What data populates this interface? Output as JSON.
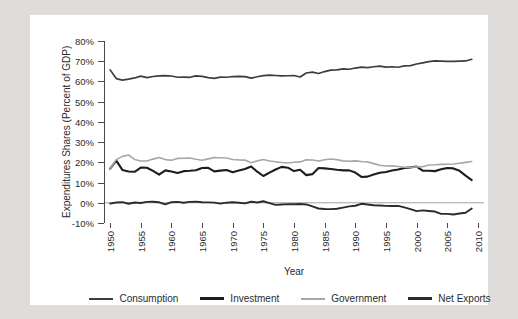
{
  "chart_data": {
    "type": "line",
    "title": "",
    "xlabel": "Year",
    "ylabel": "Expenditures Shares (Percent of GDP)",
    "xlim": [
      1949,
      2011
    ],
    "ylim": [
      -10,
      80
    ],
    "ytick_labels": [
      "80%",
      "70%",
      "60%",
      "50%",
      "40%",
      "30%",
      "20%",
      "10%",
      "0%",
      "-10%"
    ],
    "ytick_values": [
      80,
      70,
      60,
      50,
      40,
      30,
      20,
      10,
      0,
      -10
    ],
    "xtick_labels": [
      "1950",
      "1955",
      "1960",
      "1965",
      "1970",
      "1975",
      "1980",
      "1985",
      "1990",
      "1995",
      "2000",
      "2005",
      "2010"
    ],
    "xtick_values": [
      1950,
      1955,
      1960,
      1965,
      1970,
      1975,
      1980,
      1985,
      1990,
      1995,
      2000,
      2005,
      2010
    ],
    "grid": false,
    "legend_position": "bottom",
    "x": [
      1950,
      1951,
      1952,
      1953,
      1954,
      1955,
      1956,
      1957,
      1958,
      1959,
      1960,
      1961,
      1962,
      1963,
      1964,
      1965,
      1966,
      1967,
      1968,
      1969,
      1970,
      1971,
      1972,
      1973,
      1974,
      1975,
      1976,
      1977,
      1978,
      1979,
      1980,
      1981,
      1982,
      1983,
      1984,
      1985,
      1986,
      1987,
      1988,
      1989,
      1990,
      1991,
      1992,
      1993,
      1994,
      1995,
      1996,
      1997,
      1998,
      1999,
      2000,
      2001,
      2002,
      2003,
      2004,
      2005,
      2006,
      2007,
      2008,
      2009
    ],
    "series": [
      {
        "name": "Consumption",
        "color": "#3d3d3d",
        "width": 1.7,
        "values": [
          66.0,
          61.2,
          60.8,
          61.3,
          61.6,
          62.6,
          62.0,
          62.3,
          62.6,
          62.9,
          62.6,
          62.0,
          62.0,
          62.2,
          62.8,
          62.4,
          61.8,
          61.8,
          62.0,
          62.1,
          62.2,
          62.3,
          62.6,
          61.6,
          62.1,
          62.8,
          63.0,
          62.9,
          62.5,
          62.6,
          63.0,
          62.3,
          64.0,
          64.7,
          64.1,
          65.0,
          65.6,
          65.8,
          66.0,
          66.0,
          66.5,
          66.9,
          67.1,
          67.4,
          67.5,
          67.1,
          67.3,
          67.2,
          67.5,
          68.1,
          68.7,
          69.3,
          69.7,
          69.9,
          70.0,
          70.1,
          70.0,
          70.2,
          70.2,
          71.0
        ]
      },
      {
        "name": "Investment",
        "color": "#1d1d1d",
        "width": 2.1,
        "values": [
          17.0,
          20.8,
          16.2,
          15.6,
          15.1,
          17.4,
          17.1,
          15.7,
          13.8,
          16.0,
          15.5,
          14.6,
          15.4,
          15.9,
          16.0,
          17.3,
          17.2,
          15.6,
          16.0,
          16.3,
          14.9,
          15.7,
          16.9,
          17.8,
          15.6,
          13.3,
          15.1,
          16.7,
          17.5,
          17.5,
          15.6,
          16.5,
          13.7,
          14.1,
          17.4,
          16.8,
          16.5,
          16.1,
          15.8,
          15.8,
          14.8,
          12.9,
          13.2,
          14.1,
          15.1,
          15.5,
          15.9,
          16.6,
          17.1,
          17.5,
          17.8,
          16.0,
          15.6,
          15.8,
          16.6,
          17.0,
          17.2,
          15.8,
          13.7,
          11.0
        ]
      },
      {
        "name": "Government",
        "color": "#a7a7a7",
        "width": 1.6,
        "values": [
          16.8,
          21.1,
          23.2,
          23.4,
          21.6,
          20.4,
          20.6,
          21.5,
          22.5,
          21.5,
          21.2,
          21.9,
          22.3,
          22.0,
          21.4,
          20.9,
          21.7,
          22.6,
          22.5,
          21.9,
          21.6,
          21.1,
          20.9,
          20.1,
          20.5,
          21.2,
          20.4,
          20.0,
          19.8,
          19.7,
          20.2,
          20.1,
          21.1,
          21.2,
          20.8,
          21.3,
          21.4,
          21.3,
          20.8,
          20.5,
          20.6,
          20.5,
          20.1,
          19.4,
          18.7,
          18.3,
          18.0,
          17.7,
          17.5,
          17.4,
          17.5,
          18.0,
          18.6,
          19.0,
          19.0,
          19.0,
          19.0,
          19.3,
          20.0,
          20.6
        ]
      },
      {
        "name": "Net Exports",
        "color": "#2b2b2b",
        "width": 1.9,
        "values": [
          -0.4,
          0.3,
          0.2,
          -0.5,
          0.1,
          -0.1,
          0.3,
          0.6,
          0.1,
          -0.5,
          0.4,
          0.4,
          0.2,
          0.3,
          0.7,
          0.4,
          0.1,
          0.1,
          -0.2,
          -0.1,
          0.1,
          -0.2,
          -0.5,
          0.4,
          -0.1,
          1.0,
          -0.3,
          -1.1,
          -1.0,
          -0.9,
          -0.5,
          -0.4,
          -0.6,
          -1.6,
          -2.6,
          -2.8,
          -3.2,
          -3.2,
          -2.2,
          -1.6,
          -1.3,
          -0.6,
          -0.7,
          -1.2,
          -1.6,
          -1.5,
          -1.7,
          -1.7,
          -2.2,
          -3.1,
          -3.9,
          -3.6,
          -4.2,
          -4.6,
          -5.3,
          -5.7,
          -5.8,
          -5.1,
          -4.8,
          -2.9
        ]
      }
    ]
  },
  "legend": {
    "items": [
      {
        "label": "Consumption",
        "color": "#3d3d3d",
        "width": 2
      },
      {
        "label": "Investment",
        "color": "#1d1d1d",
        "width": 3
      },
      {
        "label": "Government",
        "color": "#a7a7a7",
        "width": 2
      },
      {
        "label": "Net Exports",
        "color": "#2b2b2b",
        "width": 3
      }
    ]
  }
}
